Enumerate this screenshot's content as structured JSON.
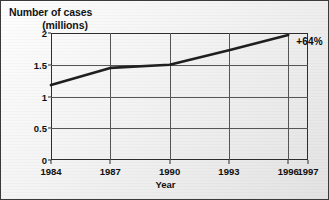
{
  "chart_data": {
    "type": "line",
    "title": "Number of cases (millions)",
    "title_line1": "Number of cases",
    "title_line2": "(millions)",
    "xlabel": "Year",
    "ylabel": "Number of cases (millions)",
    "x": [
      1984,
      1987,
      1990,
      1993,
      1996
    ],
    "values": [
      1.18,
      1.45,
      1.5,
      1.73,
      1.97
    ],
    "series": [
      {
        "name": "Number of cases",
        "values": [
          1.18,
          1.45,
          1.5,
          1.73,
          1.97
        ]
      }
    ],
    "categories": [
      "1984",
      "1987",
      "1990",
      "1993",
      "1996"
    ],
    "xticks": [
      "1984",
      "1987",
      "1990",
      "1993",
      "1996",
      "1997"
    ],
    "xtick_values": [
      1984,
      1987,
      1990,
      1993,
      1996,
      1997
    ],
    "yticks": [
      "0",
      "0.5",
      "1",
      "1.5",
      "2"
    ],
    "ytick_values": [
      0,
      0.5,
      1,
      1.5,
      2
    ],
    "xlim": [
      1984,
      1997
    ],
    "ylim": [
      0,
      2
    ],
    "grid": true,
    "legend": "none",
    "annotations": [
      {
        "text": "+64%",
        "x": 1996.4,
        "y": 1.88
      }
    ],
    "line_color": "#1f1f1f",
    "grid_color": "#555555",
    "frame_color": "#2e2e2e",
    "background_color": "#efefef"
  }
}
